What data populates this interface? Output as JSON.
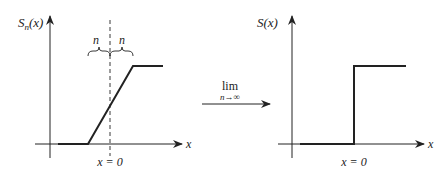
{
  "left_graph": {
    "y_label": "S",
    "y_label_sub": "n",
    "y_label_arg": "(x)",
    "x_axis_label": "x",
    "origin_label": "x = 0",
    "brace_left_label": "n",
    "brace_right_label": "n"
  },
  "limit_arrow": {
    "operator": "lim",
    "subscript": "n→∞"
  },
  "right_graph": {
    "y_label": "S(x)",
    "x_axis_label": "x",
    "origin_label": "x = 0"
  },
  "colors": {
    "line": "#222222",
    "background": "#ffffff"
  }
}
